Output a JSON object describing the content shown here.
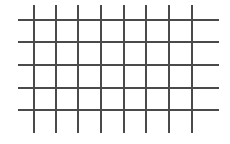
{
  "canvas": {
    "width": 230,
    "height": 144,
    "background": "#ffffff",
    "line_color": "#4a4a4a",
    "line_width": 1.5
  },
  "grid": {
    "vertical_lines": {
      "x": [
        34,
        56,
        78,
        101,
        124,
        146,
        169,
        192
      ],
      "y_start": 5,
      "y_end": 133
    },
    "horizontal_lines": {
      "y": [
        20,
        42,
        65,
        88,
        110
      ],
      "x_start": 18,
      "x_end": 219
    }
  }
}
